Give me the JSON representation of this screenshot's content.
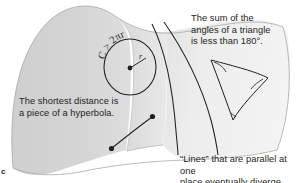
{
  "figure": {
    "label": "c",
    "type": "hyperbolic-saddle-surface-diagram",
    "background_color": "#ffffff",
    "ink_color": "#231f20"
  },
  "surface": {
    "name": "saddle-surface",
    "shading": {
      "left_lobe_color": "#d2d2d2",
      "mid_color": "#dcdcdc",
      "right_face_color": "#efefef",
      "outline_color": "#9a9a9a"
    }
  },
  "annotations": {
    "triangle_sum": "The sum of the\nangles of a triangle\nis less than 180°.",
    "shortest_distance": "The shortest distance is\na piece of a hyperbola.",
    "parallel_lines": "“Lines” that are parallel at one\nplace eventually diverge."
  },
  "circle": {
    "name": "circumference-circle",
    "label": "C > 2πr",
    "radius_label": "r",
    "center_marker": "filled-dot"
  },
  "geodesic": {
    "name": "geodesic-hyperbola-segment",
    "endpoint_markers": 2
  },
  "parallel_curves": {
    "name": "diverging-parallel-geodesics",
    "count": 2
  },
  "hyperbolic_triangle": {
    "name": "hyperbolic-triangle",
    "vertices": 3,
    "side_style": "concave-inward",
    "angle_marks": 3
  }
}
